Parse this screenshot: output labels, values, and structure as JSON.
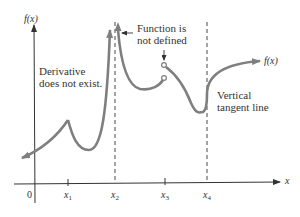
{
  "diagram": {
    "type": "function-graph",
    "y_axis_label": "f(x)",
    "x_axis_label": "x",
    "curve_label": "f(x)",
    "origin_label": "0",
    "x_ticks": [
      {
        "name": "x",
        "sub": "1"
      },
      {
        "name": "x",
        "sub": "2"
      },
      {
        "name": "x",
        "sub": "3"
      },
      {
        "name": "x",
        "sub": "4"
      }
    ],
    "annotations": {
      "derivative": [
        "Derivative",
        "does not exist."
      ],
      "undefined": [
        "Function is",
        "not defined"
      ],
      "vertical_tangent": [
        "Vertical",
        "tangent line"
      ]
    },
    "colors": {
      "curve": "#7f7f7f",
      "axis": "#333333",
      "text": "#333333"
    }
  }
}
